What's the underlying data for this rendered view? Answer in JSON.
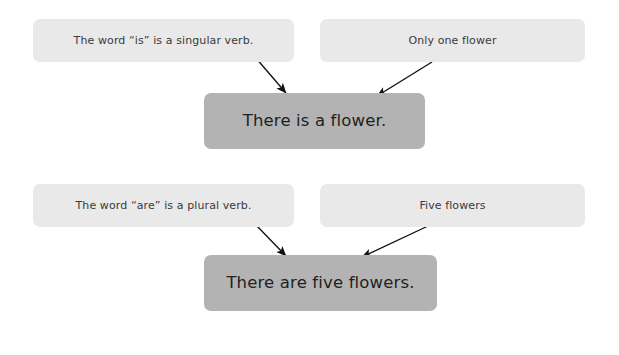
{
  "page": {
    "background_color": "#ffffff"
  },
  "colors": {
    "premise_box": "#e9e9e9",
    "conclusion_box": "#b3b3b3",
    "premise_text": "#3a3a3a",
    "conclusion_text": "#1f1f1f",
    "arrow": "#111111"
  },
  "groups": [
    {
      "id": "singular",
      "premises": [
        {
          "id": "top-left",
          "text": "The word “is” is a singular verb."
        },
        {
          "id": "top-right",
          "text": "Only one flower"
        }
      ],
      "conclusion": {
        "id": "top-result",
        "text": "There is a flower."
      },
      "arrows": [
        {
          "id": "arrow-top-left",
          "from": [
            255,
            57
          ],
          "to": [
            289,
            96
          ]
        },
        {
          "id": "arrow-top-right",
          "from": [
            432,
            62
          ],
          "to": [
            373,
            99
          ]
        }
      ]
    },
    {
      "id": "plural",
      "premises": [
        {
          "id": "bottom-left",
          "text": "The word “are” is a plural verb."
        },
        {
          "id": "bottom-right",
          "text": "Five flowers"
        }
      ],
      "conclusion": {
        "id": "bottom-result",
        "text": "There are five flowers."
      },
      "arrows": [
        {
          "id": "arrow-bottom-left",
          "from": [
            255,
            224
          ],
          "to": [
            289,
            259
          ]
        },
        {
          "id": "arrow-bottom-right",
          "from": [
            428,
            226
          ],
          "to": [
            358,
            259
          ]
        }
      ]
    }
  ]
}
